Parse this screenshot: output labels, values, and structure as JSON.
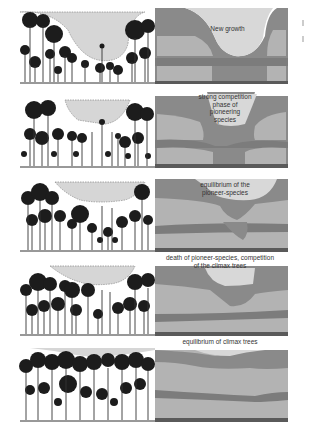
{
  "figure": {
    "colors": {
      "sky_gap": "#d9d9d9",
      "canopy_dark": "#7a7a7a",
      "layer_light": "#b5b5b5",
      "band_dark": "#8a8a8a",
      "tree_black": "#1a1a1a",
      "ground": "#555555"
    },
    "stages": [
      {
        "id": 1,
        "label": "New growth"
      },
      {
        "id": 2,
        "label": "strong competition\nphase of\npioneering\nspecies"
      },
      {
        "id": 3,
        "label": "equilibrium of the\npioneer-species"
      },
      {
        "id": 4,
        "label": "death of pioneer-species, competition\nof the climax trees"
      },
      {
        "id": 5,
        "label": "equilibrium of climax trees"
      }
    ]
  }
}
